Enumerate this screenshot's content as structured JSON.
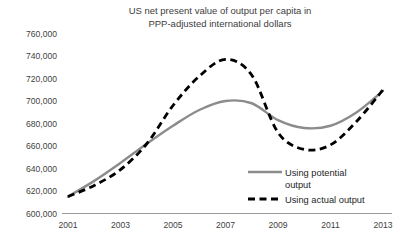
{
  "chart_data": {
    "type": "line",
    "title": "US net present value of output per capita in\nPPP-adjusted international dollars",
    "title_line1": "US net present value of output per capita in",
    "title_line2": "PPP-adjusted international dollars",
    "xlabel": "",
    "ylabel": "",
    "ylim": [
      600000,
      760000
    ],
    "xlim": [
      2001,
      2013
    ],
    "ytick_labels": [
      "760,000",
      "740,000",
      "720,000",
      "700,000",
      "680,000",
      "660,000",
      "640,000",
      "620,000",
      "600,000"
    ],
    "ytick_values": [
      760000,
      740000,
      720000,
      700000,
      680000,
      660000,
      640000,
      620000,
      600000
    ],
    "xtick_labels": [
      "2001",
      "2003",
      "2005",
      "2007",
      "2009",
      "2011",
      "2013"
    ],
    "xtick_values": [
      2001,
      2003,
      2005,
      2007,
      2009,
      2011,
      2013
    ],
    "grid": false,
    "legend_position": "inside-bottom-right",
    "x": [
      2001,
      2002,
      2003,
      2004,
      2005,
      2006,
      2007,
      2008,
      2009,
      2010,
      2011,
      2012,
      2013
    ],
    "series": [
      {
        "name": "Using potential output",
        "style": "solid",
        "color": "#8c8c8c",
        "values": [
          615000,
          629000,
          645000,
          662000,
          678000,
          692000,
          700000,
          698000,
          683000,
          676000,
          678000,
          690000,
          709000
        ]
      },
      {
        "name": "Using actual output",
        "style": "dashed",
        "color": "#000000",
        "values": [
          615000,
          625000,
          639000,
          662000,
          696000,
          722000,
          737000,
          723000,
          672000,
          657000,
          661000,
          682000,
          710000
        ]
      }
    ]
  },
  "legend": {
    "items": [
      {
        "label_line1": "Using potential",
        "label_line2": "output",
        "label": "Using potential output"
      },
      {
        "label_line1": "Using actual output",
        "label_line2": "",
        "label": "Using actual output"
      }
    ]
  }
}
